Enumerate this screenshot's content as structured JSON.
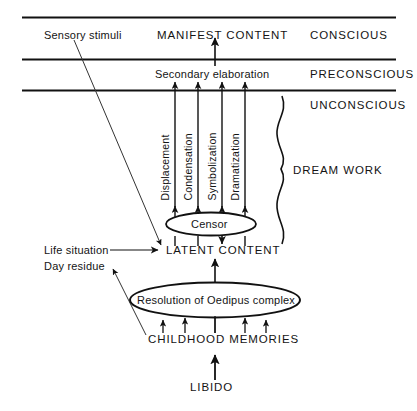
{
  "diagram": {
    "levels": [
      {
        "id": "conscious",
        "label": "CONSCIOUS"
      },
      {
        "id": "preconscious",
        "label": "PRECONSCIOUS"
      },
      {
        "id": "unconscious",
        "label": "UNCONSCIOUS"
      }
    ],
    "nodes": {
      "manifest_content": "MANIFEST  CONTENT",
      "secondary_elaboration": "Secondary elaboration",
      "censor": "Censor",
      "latent_content": "LATENT  CONTENT",
      "oedipus": "Resolution of Oedipus complex",
      "childhood_memories": "CHILDHOOD  MEMORIES",
      "libido": "LIBIDO"
    },
    "dream_work": {
      "bracket_label": "DREAM  WORK",
      "mechanisms": [
        "Displacement",
        "Condensation",
        "Symbolization",
        "Dramatization"
      ]
    },
    "inputs": {
      "sensory_stimuli": "Sensory stimuli",
      "life_situation": "Life situation",
      "day_residue": "Day residue"
    },
    "colors": {
      "stroke": "#111111",
      "text": "#141414",
      "background": "#ffffff"
    }
  }
}
